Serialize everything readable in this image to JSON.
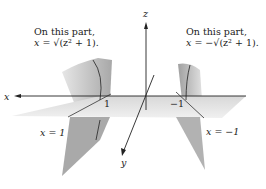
{
  "figure": {
    "axes": {
      "x": "x",
      "y": "y",
      "z": "z"
    },
    "ticks": {
      "x_pos": "1",
      "x_neg": "−1"
    },
    "annotations": {
      "left": {
        "line1": "On this part,",
        "line2_prefix": "x = ",
        "line2_expr": "√(z² + 1)."
      },
      "right": {
        "line1": "On this part,",
        "line2_prefix": "x = −",
        "line2_expr": "√(z² + 1)."
      }
    },
    "plane_labels": {
      "left": "x = 1",
      "right": "x = −1"
    }
  }
}
